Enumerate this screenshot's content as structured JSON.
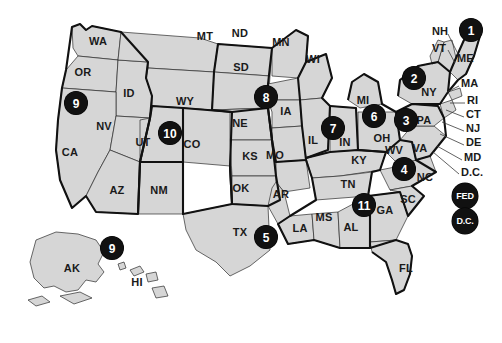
{
  "map": {
    "title": "United States Federal Judicial Circuits",
    "background_color": "#ffffff",
    "state_fill_color": "#d6d6d6",
    "state_border_color": "#2b2b2b",
    "circuit_border_color": "#111111",
    "badge_fill_color": "#111111",
    "badge_text_color": "#ffffff"
  },
  "state_labels": [
    {
      "code": "WA",
      "x": 98,
      "y": 41
    },
    {
      "code": "OR",
      "x": 83,
      "y": 72
    },
    {
      "code": "ID",
      "x": 129,
      "y": 93
    },
    {
      "code": "MT",
      "x": 205,
      "y": 36
    },
    {
      "code": "ND",
      "x": 240,
      "y": 33
    },
    {
      "code": "SD",
      "x": 241,
      "y": 67
    },
    {
      "code": "MN",
      "x": 281,
      "y": 42
    },
    {
      "code": "WI",
      "x": 313,
      "y": 59
    },
    {
      "code": "NV",
      "x": 104,
      "y": 126
    },
    {
      "code": "UT",
      "x": 143,
      "y": 142
    },
    {
      "code": "WY",
      "x": 185,
      "y": 101
    },
    {
      "code": "CO",
      "x": 192,
      "y": 144
    },
    {
      "code": "NE",
      "x": 240,
      "y": 123
    },
    {
      "code": "IA",
      "x": 286,
      "y": 111
    },
    {
      "code": "CA",
      "x": 70,
      "y": 152
    },
    {
      "code": "AZ",
      "x": 117,
      "y": 190
    },
    {
      "code": "NM",
      "x": 159,
      "y": 190
    },
    {
      "code": "KS",
      "x": 250,
      "y": 156
    },
    {
      "code": "MO",
      "x": 275,
      "y": 155
    },
    {
      "code": "IL",
      "x": 313,
      "y": 140
    },
    {
      "code": "IN",
      "x": 345,
      "y": 142
    },
    {
      "code": "MI",
      "x": 363,
      "y": 100
    },
    {
      "code": "OH",
      "x": 382,
      "y": 138
    },
    {
      "code": "OK",
      "x": 241,
      "y": 188
    },
    {
      "code": "AR",
      "x": 281,
      "y": 194
    },
    {
      "code": "KY",
      "x": 359,
      "y": 160
    },
    {
      "code": "TN",
      "x": 348,
      "y": 184
    },
    {
      "code": "WV",
      "x": 394,
      "y": 150
    },
    {
      "code": "VA",
      "x": 420,
      "y": 148
    },
    {
      "code": "NC",
      "x": 425,
      "y": 177
    },
    {
      "code": "SC",
      "x": 408,
      "y": 199
    },
    {
      "code": "GA",
      "x": 385,
      "y": 210
    },
    {
      "code": "AL",
      "x": 351,
      "y": 227
    },
    {
      "code": "MS",
      "x": 324,
      "y": 217
    },
    {
      "code": "LA",
      "x": 300,
      "y": 228
    },
    {
      "code": "TX",
      "x": 240,
      "y": 232
    },
    {
      "code": "FL",
      "x": 406,
      "y": 268
    },
    {
      "code": "NY",
      "x": 429,
      "y": 92
    },
    {
      "code": "PA",
      "x": 424,
      "y": 120
    },
    {
      "code": "AK",
      "x": 72,
      "y": 268
    },
    {
      "code": "HI",
      "x": 137,
      "y": 282
    }
  ],
  "edge_labels": [
    {
      "code": "NH",
      "x": 432,
      "y": 31,
      "line": [
        448,
        34,
        459,
        56
      ]
    },
    {
      "code": "VT",
      "x": 432,
      "y": 48,
      "line": [
        448,
        50,
        455,
        63
      ]
    },
    {
      "code": "ME",
      "x": 457,
      "y": 58,
      "line": null
    },
    {
      "code": "MA",
      "x": 461,
      "y": 83,
      "line": [
        459,
        86,
        447,
        92
      ]
    },
    {
      "code": "RI",
      "x": 467,
      "y": 100,
      "line": [
        465,
        103,
        450,
        103
      ]
    },
    {
      "code": "CT",
      "x": 466,
      "y": 114,
      "line": [
        464,
        117,
        446,
        110
      ]
    },
    {
      "code": "NJ",
      "x": 466,
      "y": 128,
      "line": [
        464,
        131,
        442,
        122
      ]
    },
    {
      "code": "DE",
      "x": 466,
      "y": 142,
      "line": [
        464,
        145,
        440,
        134
      ]
    },
    {
      "code": "MD",
      "x": 464,
      "y": 157,
      "line": [
        462,
        160,
        437,
        146
      ]
    },
    {
      "code": "D.C.",
      "x": 461,
      "y": 172,
      "line": [
        459,
        174,
        433,
        152
      ]
    }
  ],
  "circuit_badges": [
    {
      "id": "1",
      "label": "1",
      "x": 471,
      "y": 30,
      "style": "num"
    },
    {
      "id": "2",
      "label": "2",
      "x": 414,
      "y": 78,
      "style": "num"
    },
    {
      "id": "3",
      "label": "3",
      "x": 406,
      "y": 120,
      "style": "num"
    },
    {
      "id": "4",
      "label": "4",
      "x": 404,
      "y": 169,
      "style": "num"
    },
    {
      "id": "5",
      "label": "5",
      "x": 266,
      "y": 237,
      "style": "num"
    },
    {
      "id": "6",
      "label": "6",
      "x": 374,
      "y": 116,
      "style": "num"
    },
    {
      "id": "7",
      "label": "7",
      "x": 333,
      "y": 128,
      "style": "num"
    },
    {
      "id": "8",
      "label": "8",
      "x": 266,
      "y": 97,
      "style": "num"
    },
    {
      "id": "9",
      "label": "9",
      "x": 76,
      "y": 103,
      "style": "num"
    },
    {
      "id": "10",
      "label": "10",
      "x": 170,
      "y": 133,
      "style": "num"
    },
    {
      "id": "11",
      "label": "11",
      "x": 364,
      "y": 205,
      "style": "num"
    },
    {
      "id": "9-ak",
      "label": "9",
      "x": 112,
      "y": 248,
      "style": "num"
    },
    {
      "id": "fed",
      "label": "FED",
      "x": 465,
      "y": 196,
      "style": "wide"
    },
    {
      "id": "dc",
      "label": "D.C.",
      "x": 465,
      "y": 221,
      "style": "wide"
    }
  ]
}
